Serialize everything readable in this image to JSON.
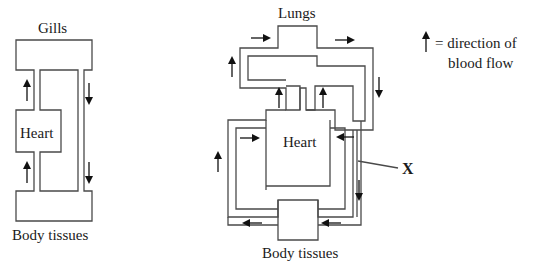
{
  "fish_circulation": {
    "title_top": "Gills",
    "heart_label": "Heart",
    "title_bottom": "Body tissues"
  },
  "mammal_circulation": {
    "title_top": "Lungs",
    "heart_label": "Heart",
    "title_bottom": "Body tissues",
    "pointer_label": "X"
  },
  "legend": {
    "icon": "up-arrow-icon",
    "line1": "= direction of",
    "line2": "blood flow"
  },
  "colors": {
    "vessel_stroke": "#4a4a4a",
    "arrow": "#111111",
    "background": "#ffffff"
  }
}
